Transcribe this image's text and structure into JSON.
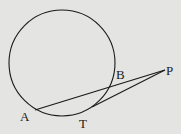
{
  "diagram": {
    "type": "geometry",
    "points": {
      "A": {
        "label": "A"
      },
      "B": {
        "label": "B"
      },
      "T": {
        "label": "T"
      },
      "P": {
        "label": "P"
      }
    },
    "segments": [
      {
        "from": "A",
        "to": "P",
        "kind": "secant"
      },
      {
        "from": "T",
        "to": "P",
        "kind": "tangent"
      }
    ],
    "colors": {
      "background": "#e4e4e2",
      "ink": "#1a1a1a"
    }
  }
}
